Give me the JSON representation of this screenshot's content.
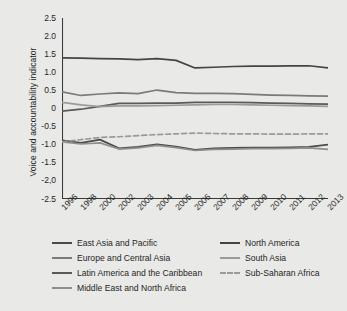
{
  "chart_data": {
    "type": "line",
    "title": "",
    "xlabel": "",
    "ylabel": "Voice and accountability indicator",
    "grid": false,
    "legend_position": "bottom",
    "ylim": [
      -2.5,
      2.5
    ],
    "yticks": [
      "2.5",
      "2.0",
      "1.5",
      "1.0",
      "0.5",
      "0",
      "-0.5",
      "-1.0",
      "-1.5",
      "-2,0",
      "-2.5"
    ],
    "ytick_values": [
      2.5,
      2.0,
      1.5,
      1.0,
      0.5,
      0,
      -0.5,
      -1.0,
      -1.5,
      -2.0,
      -2.5
    ],
    "categories": [
      "1996",
      "1998",
      "2000",
      "2002",
      "2003",
      "2004",
      "2005",
      "2006",
      "2007",
      "2008",
      "2009",
      "2010",
      "2011",
      "2012",
      "2013"
    ],
    "series": [
      {
        "name": "East Asia and Pacific",
        "color": "#4a4a4a",
        "style": "solid",
        "values": [
          -0.88,
          -0.95,
          -0.86,
          -1.1,
          -1.06,
          -0.99,
          -1.05,
          -1.14,
          -1.1,
          -1.09,
          -1.08,
          -1.08,
          -1.07,
          -1.06,
          -1.0
        ]
      },
      {
        "name": "Europe and Central Asia",
        "color": "#7a7a7a",
        "style": "solid",
        "values": [
          0.46,
          0.36,
          0.4,
          0.43,
          0.41,
          0.51,
          0.44,
          0.42,
          0.42,
          0.41,
          0.39,
          0.37,
          0.36,
          0.35,
          0.34
        ]
      },
      {
        "name": "Latin America and the Caribbean",
        "color": "#5a5a5a",
        "style": "solid",
        "values": [
          -0.07,
          -0.02,
          0.06,
          0.14,
          0.14,
          0.15,
          0.15,
          0.17,
          0.17,
          0.17,
          0.16,
          0.15,
          0.14,
          0.13,
          0.12
        ]
      },
      {
        "name": "Middle East and North Africa",
        "color": "#8e8e8e",
        "style": "solid",
        "values": [
          -0.92,
          -0.98,
          -0.95,
          -1.12,
          -1.09,
          -1.02,
          -1.08,
          -1.16,
          -1.13,
          -1.12,
          -1.11,
          -1.11,
          -1.1,
          -1.09,
          -1.13
        ]
      },
      {
        "name": "North America",
        "color": "#444444",
        "style": "solid",
        "values": [
          1.4,
          1.39,
          1.38,
          1.37,
          1.35,
          1.38,
          1.33,
          1.12,
          1.14,
          1.16,
          1.17,
          1.17,
          1.18,
          1.18,
          1.12
        ]
      },
      {
        "name": "South Asia",
        "color": "#9b9b9b",
        "style": "solid",
        "values": [
          0.17,
          0.1,
          0.05,
          0.07,
          0.07,
          0.08,
          0.09,
          0.1,
          0.11,
          0.11,
          0.1,
          0.09,
          0.08,
          0.07,
          0.06
        ]
      },
      {
        "name": "Sub-Saharan Africa",
        "color": "#9a9a9a",
        "style": "dashed",
        "values": [
          -0.92,
          -0.86,
          -0.8,
          -0.78,
          -0.75,
          -0.72,
          -0.7,
          -0.68,
          -0.69,
          -0.7,
          -0.7,
          -0.71,
          -0.71,
          -0.7,
          -0.7
        ]
      }
    ]
  },
  "legend": {
    "items": [
      {
        "label": "East Asia and Pacific",
        "color": "#4a4a4a",
        "style": "solid"
      },
      {
        "label": "Europe and Central Asia",
        "color": "#7a7a7a",
        "style": "solid"
      },
      {
        "label": "Latin America and the Caribbean",
        "color": "#5a5a5a",
        "style": "solid"
      },
      {
        "label": "Middle East and North Africa",
        "color": "#8e8e8e",
        "style": "solid"
      },
      {
        "label": "North America",
        "color": "#444444",
        "style": "solid"
      },
      {
        "label": "South Asia",
        "color": "#9b9b9b",
        "style": "solid"
      },
      {
        "label": "Sub-Saharan Africa",
        "color": "#9a9a9a",
        "style": "dashed"
      }
    ]
  }
}
